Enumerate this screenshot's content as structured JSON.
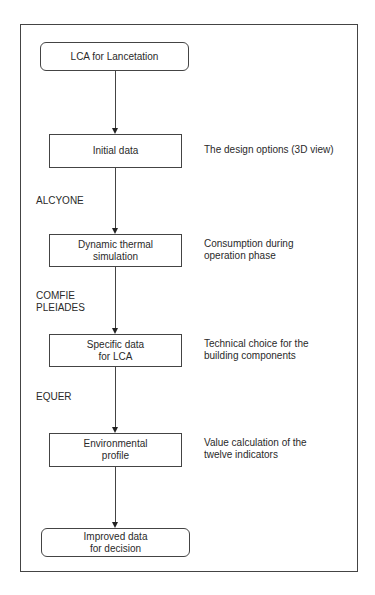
{
  "diagram": {
    "type": "flowchart",
    "orientation": "vertical",
    "nodes": [
      {
        "id": "start",
        "shape": "rounded",
        "label": "LCA for Lancetation"
      },
      {
        "id": "initial",
        "shape": "rect",
        "label": "Initial data",
        "note": "The design options (3D view)"
      },
      {
        "id": "thermal",
        "shape": "rect",
        "label_line1": "Dynamic thermal",
        "label_line2": "simulation",
        "note_line1": "Consumption during",
        "note_line2": "operation phase"
      },
      {
        "id": "specific",
        "shape": "rect",
        "label_line1": "Specific data",
        "label_line2": "for LCA",
        "note_line1": "Technical choice for the",
        "note_line2": "building components"
      },
      {
        "id": "environmental",
        "shape": "rect",
        "label_line1": "Environmental",
        "label_line2": "profile",
        "note_line1": "Value calculation of the",
        "note_line2": "twelve indicators"
      },
      {
        "id": "end",
        "shape": "rounded",
        "label_line1": "Improved data",
        "label_line2": "for decision"
      }
    ],
    "edges": [
      {
        "from": "start",
        "to": "initial",
        "tool": ""
      },
      {
        "from": "initial",
        "to": "thermal",
        "tool": "ALCYONE"
      },
      {
        "from": "thermal",
        "to": "specific",
        "tool_line1": "COMFIE",
        "tool_line2": "PLEIADES"
      },
      {
        "from": "specific",
        "to": "environmental",
        "tool": "EQUER"
      },
      {
        "from": "environmental",
        "to": "end",
        "tool": ""
      }
    ]
  }
}
